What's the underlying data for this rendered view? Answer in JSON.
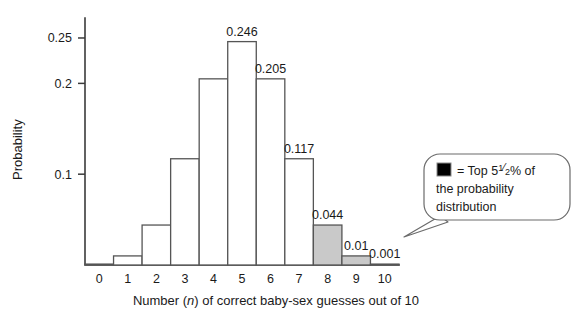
{
  "chart_data": {
    "type": "bar",
    "title": "",
    "xlabel_prefix": "Number (",
    "xlabel_italic": "n",
    "xlabel_suffix": ") of correct baby-sex guesses out of 10",
    "ylabel": "Probability",
    "categories": [
      "0",
      "1",
      "2",
      "3",
      "4",
      "5",
      "6",
      "7",
      "8",
      "9",
      "10"
    ],
    "values": [
      0.001,
      0.01,
      0.044,
      0.117,
      0.205,
      0.246,
      0.205,
      0.117,
      0.044,
      0.01,
      0.001
    ],
    "value_labels": [
      "",
      "",
      "",
      "",
      "",
      "0.246",
      "0.205",
      "0.117",
      "0.044",
      "0.01",
      "0.001"
    ],
    "highlighted": [
      false,
      false,
      false,
      false,
      false,
      false,
      false,
      false,
      true,
      true,
      true
    ],
    "ylim": [
      0,
      0.272
    ],
    "xlim": [
      -0.5,
      10.5
    ],
    "yticks": [
      0.1,
      0.2,
      0.25
    ],
    "ytick_labels": [
      "0.1",
      "0.2",
      "0.25"
    ],
    "grid": false,
    "legend_position": "inside-right"
  },
  "callout": {
    "swatch_label": "= Top 5",
    "fraction_numerator": "1",
    "fraction_denominator": "2",
    "percent": "% of",
    "line2": "the probability",
    "line3": "distribution",
    "swatch_color": "#c9c9c9"
  },
  "colors": {
    "bar_fill": "#ffffff",
    "bar_highlight_fill": "#c9c9c9",
    "bar_stroke": "#555555",
    "axis": "#3b3b3b",
    "text": "#1a1a1a"
  }
}
